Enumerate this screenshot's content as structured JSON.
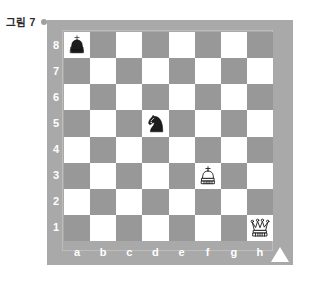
{
  "caption": {
    "label": "그림 7",
    "marker": "bullet-dot"
  },
  "board": {
    "title": "chess-board",
    "files": [
      "a",
      "b",
      "c",
      "d",
      "e",
      "f",
      "g",
      "h"
    ],
    "ranks": [
      "8",
      "7",
      "6",
      "5",
      "4",
      "3",
      "2",
      "1"
    ],
    "colors": {
      "frame": "#a9a9a9",
      "dark_square": "#989898",
      "light_square": "#ffffff",
      "label_text": "#ffffff",
      "caption_text": "#2b2b2b",
      "marker": "#ffffff"
    },
    "orientation": "white-bottom",
    "corner_marker": "triangle-up-icon",
    "pieces": [
      {
        "square": "a8",
        "piece": "king",
        "color": "black",
        "glyph": "♚"
      },
      {
        "square": "d5",
        "piece": "knight",
        "color": "black",
        "glyph": "♞"
      },
      {
        "square": "f3",
        "piece": "king",
        "color": "white",
        "glyph": "♔"
      },
      {
        "square": "h1",
        "piece": "queen",
        "color": "white",
        "glyph": "♕"
      }
    ]
  },
  "chart_data": {
    "type": "table",
    "title": "그림 7",
    "xlabel": "file",
    "ylabel": "rank",
    "categories": [
      "a",
      "b",
      "c",
      "d",
      "e",
      "f",
      "g",
      "h"
    ],
    "rows": [
      "8",
      "7",
      "6",
      "5",
      "4",
      "3",
      "2",
      "1"
    ],
    "values": [
      [
        "bK",
        "",
        "",
        "",
        "",
        "",
        "",
        ""
      ],
      [
        "",
        "",
        "",
        "",
        "",
        "",
        "",
        ""
      ],
      [
        "",
        "",
        "",
        "",
        "",
        "",
        "",
        ""
      ],
      [
        "",
        "",
        "",
        "bN",
        "",
        "",
        "",
        ""
      ],
      [
        "",
        "",
        "",
        "",
        "",
        "",
        "",
        ""
      ],
      [
        "",
        "",
        "",
        "",
        "",
        "wK",
        "",
        ""
      ],
      [
        "",
        "",
        "",
        "",
        "",
        "",
        "",
        ""
      ],
      [
        "",
        "",
        "",
        "",
        "",
        "",
        "",
        "wQ"
      ]
    ]
  }
}
